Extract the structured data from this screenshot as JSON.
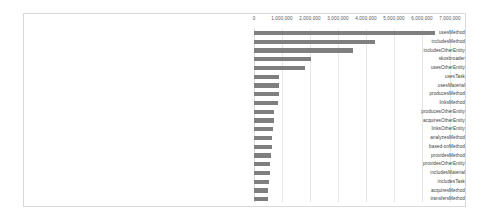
{
  "chart_data": {
    "type": "bar",
    "orientation": "horizontal",
    "title": "",
    "subtitle": "",
    "xlabel": "",
    "ylabel": "",
    "xlim": [
      0,
      7000000
    ],
    "grid": true,
    "legend": "none",
    "series_color": "#7f7f7f",
    "tick_labels": [
      "0",
      "1,000,000",
      "2,000,000",
      "3,000,000",
      "4,000,000",
      "5,000,000",
      "6,000,000",
      "7,000,000"
    ],
    "ticks": [
      0,
      1000000,
      2000000,
      3000000,
      4000000,
      5000000,
      6000000,
      7000000
    ],
    "categories": [
      "usesMethod",
      "includesMethod",
      "includesOtherEntity",
      "skosbroader",
      "usesOtherEntity",
      "usesTask",
      "usesMaterial",
      "producesMethod",
      "linksMethod",
      "producesOtherEntity",
      "acquiresOtherEntity",
      "linksOtherEntity",
      "analyzesMethod",
      "based-onMethod",
      "providesMethod",
      "providesOtherEntity",
      "includesMaterial",
      "includesTask",
      "acquiresMethod",
      "transfersMethod"
    ],
    "values": [
      6480000,
      4330000,
      3520000,
      2040000,
      1810000,
      910000,
      900000,
      880000,
      860000,
      710000,
      700000,
      680000,
      660000,
      640000,
      620000,
      570000,
      560000,
      550000,
      510000,
      500000
    ]
  }
}
